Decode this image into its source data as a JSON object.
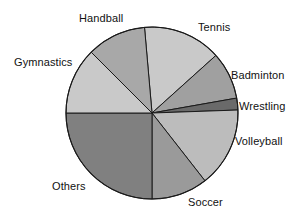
{
  "chart_data": {
    "type": "pie",
    "title": "",
    "subtitle": "",
    "xlabel": "",
    "ylabel": "",
    "legend_position": "none",
    "labels_position": "outside",
    "grid": false,
    "categories": [
      "Tennis",
      "Badminton",
      "Wrestling",
      "Volleyball",
      "Soccer",
      "Others",
      "Gymnastics",
      "Handball"
    ],
    "values": [
      14.7,
      8.9,
      2.2,
      15.0,
      10.6,
      25.0,
      12.5,
      11.1
    ],
    "value_unit": "percent",
    "slices": [
      {
        "label": "Tennis",
        "value": 14.7,
        "start_angle": 95,
        "end_angle": 42,
        "color": "#c9c9c9"
      },
      {
        "label": "Badminton",
        "value": 8.9,
        "start_angle": 42,
        "end_angle": 10,
        "color": "#a0a0a0"
      },
      {
        "label": "Wrestling",
        "value": 2.2,
        "start_angle": 10,
        "end_angle": 2,
        "color": "#6a6a6a"
      },
      {
        "label": "Volleyball",
        "value": 15.0,
        "start_angle": 2,
        "end_angle": -52,
        "color": "#bcbcbc"
      },
      {
        "label": "Soccer",
        "value": 10.6,
        "start_angle": -52,
        "end_angle": -90,
        "color": "#9a9a9a"
      },
      {
        "label": "Others",
        "value": 25.0,
        "start_angle": -90,
        "end_angle": -180,
        "color": "#808080"
      },
      {
        "label": "Gymnastics",
        "value": 12.5,
        "start_angle": 180,
        "end_angle": 135,
        "color": "#c9c9c9"
      },
      {
        "label": "Handball",
        "value": 11.1,
        "start_angle": 135,
        "end_angle": 95,
        "color": "#a8a8a8"
      }
    ],
    "geometry": {
      "cx": 152,
      "cy": 113,
      "r": 86
    },
    "colors": {
      "outline": "#1a1a1a",
      "background": "#ffffff",
      "label_text": "#111111"
    }
  },
  "labels": {
    "tennis": "Tennis",
    "badminton": "Badminton",
    "wrestling": "Wrestling",
    "volleyball": "Volleyball",
    "soccer": "Soccer",
    "others": "Others",
    "gymnastics": "Gymnastics",
    "handball": "Handball"
  }
}
